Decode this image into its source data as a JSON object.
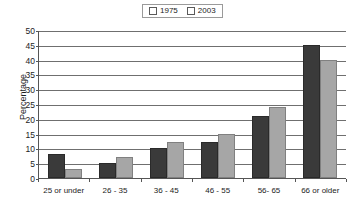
{
  "chart_data": {
    "type": "bar",
    "title": "",
    "xlabel": "",
    "ylabel": "Percentage",
    "ylim": [
      0,
      50
    ],
    "ytick_step": 5,
    "yticks": [
      50,
      45,
      40,
      35,
      30,
      25,
      20,
      15,
      10,
      5,
      0
    ],
    "grid": true,
    "legend_position": "top-center",
    "categories": [
      "25 or under",
      "26 - 35",
      "36 - 45",
      "46 - 55",
      "56- 65",
      "66 or older"
    ],
    "series": [
      {
        "name": "1975",
        "color": "#3a3a3a",
        "values": [
          8,
          5,
          10,
          12,
          21,
          45
        ]
      },
      {
        "name": "2003",
        "color": "#a6a6a6",
        "values": [
          3,
          7,
          12,
          15,
          24,
          40
        ]
      }
    ]
  },
  "legend": {
    "entries": [
      {
        "label": "1975"
      },
      {
        "label": "2003"
      }
    ]
  }
}
